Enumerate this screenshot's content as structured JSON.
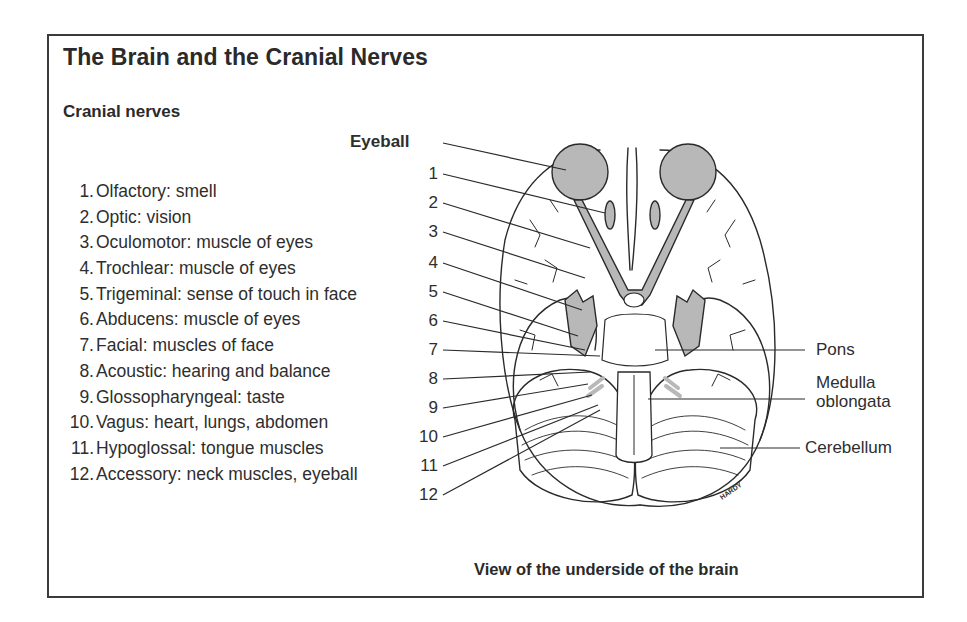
{
  "title": "The Brain and the Cranial Nerves",
  "subtitle": "Cranial nerves",
  "nerves": [
    {
      "num": "1.",
      "label": "Olfactory: smell"
    },
    {
      "num": "2.",
      "label": "Optic: vision"
    },
    {
      "num": "3.",
      "label": "Oculomotor: muscle of eyes"
    },
    {
      "num": "4.",
      "label": "Trochlear: muscle of eyes"
    },
    {
      "num": "5.",
      "label": "Trigeminal: sense of touch in face"
    },
    {
      "num": "6.",
      "label": "Abducens: muscle of eyes"
    },
    {
      "num": "7.",
      "label": "Facial: muscles of face"
    },
    {
      "num": "8.",
      "label": "Acoustic: hearing and balance"
    },
    {
      "num": "9.",
      "label": "Glossopharyngeal: taste"
    },
    {
      "num": "10.",
      "label": "Vagus: heart, lungs, abdomen"
    },
    {
      "num": "11.",
      "label": "Hypoglossal: tongue muscles"
    },
    {
      "num": "12.",
      "label": "Accessory: neck muscles, eyeball"
    }
  ],
  "diagram": {
    "eyeball_label": "Eyeball",
    "callout_numbers": [
      "1",
      "2",
      "3",
      "4",
      "5",
      "6",
      "7",
      "8",
      "9",
      "10",
      "11",
      "12"
    ],
    "right_labels": {
      "pons": "Pons",
      "medulla_line1": "Medulla",
      "medulla_line2": "oblongata",
      "cerebellum": "Cerebellum"
    },
    "signature": "HARDY",
    "caption": "View of the underside of the brain",
    "colors": {
      "line": "#2a2a2a",
      "nerve_fill": "#b8b8b8",
      "paper": "#ffffff"
    }
  }
}
